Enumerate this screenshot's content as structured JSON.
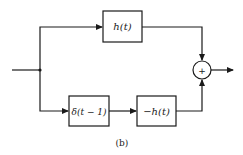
{
  "diagram": {
    "caption": "(b)",
    "blocks": [
      {
        "id": "h",
        "label": "h(t)"
      },
      {
        "id": "delay",
        "label": "δ(t − 1)"
      },
      {
        "id": "neg_h",
        "label": "−h(t)"
      }
    ],
    "summer": {
      "symbol": "+"
    },
    "colors": {
      "line": "#1a1a1a",
      "background": "#ffffff"
    }
  }
}
